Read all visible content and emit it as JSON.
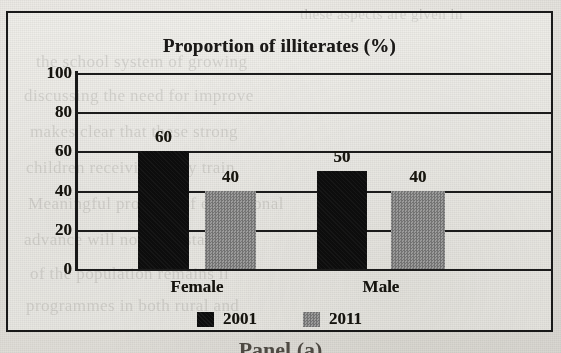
{
  "chart_data": {
    "type": "bar",
    "title": "Proportion of illiterates (%)",
    "xlabel": "",
    "ylabel": "",
    "ylim": [
      0,
      100
    ],
    "yticks": [
      0,
      20,
      40,
      60,
      80,
      100
    ],
    "grid": true,
    "legend_position": "bottom",
    "categories": [
      "Female",
      "Male"
    ],
    "series": [
      {
        "name": "2001",
        "color": "#0d0d0d",
        "values": [
          60,
          50
        ]
      },
      {
        "name": "2011",
        "color": "#8d8d8d",
        "values": [
          40,
          40
        ]
      }
    ],
    "data_labels": [
      {
        "category": "Female",
        "series": "2001",
        "value": 60,
        "text": "60"
      },
      {
        "category": "Female",
        "series": "2011",
        "value": 40,
        "text": "40"
      },
      {
        "category": "Male",
        "series": "2001",
        "value": 50,
        "text": "50"
      },
      {
        "category": "Male",
        "series": "2011",
        "value": 40,
        "text": "40"
      }
    ]
  },
  "figure": {
    "title": "Proportion of illiterates (%)",
    "ytick_labels": [
      "100",
      "80",
      "60",
      "40",
      "20",
      "0"
    ],
    "category_labels": [
      "Female",
      "Male"
    ],
    "legend": [
      {
        "label": "2001",
        "swatch": "black-swatch"
      },
      {
        "label": "2011",
        "swatch": "gray-swatch"
      }
    ],
    "bar_labels": [
      "60",
      "40",
      "50",
      "40"
    ],
    "caption": "Panel (a)",
    "colors": {
      "series_2001": "#0d0d0d",
      "series_2011": "#8d8d8d",
      "axis": "#1a1a1a",
      "text": "#17150f",
      "paper": "#e9e7e2"
    }
  },
  "background_text": {
    "top": "these aspects are given in",
    "line1": "the  school  system   of  growing",
    "line2": "discussing the  need  for  improve",
    "line3": "makes  clear  that  these  strong",
    "line4": "children   receiving   early   train",
    "line5": "Meaningful progress of  educational",
    "line6": "advance  will   not   be   sustaine",
    "line7": "of   the   population   remains    il",
    "line8": "programmes  in  both  rural  and"
  }
}
